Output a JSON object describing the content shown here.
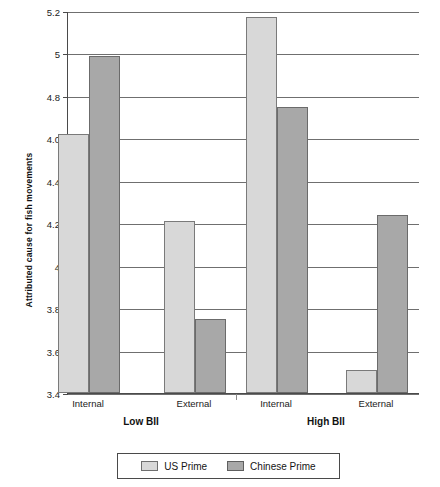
{
  "chart_data": {
    "type": "bar",
    "title": "",
    "xlabel": "",
    "ylabel": "Attributed cause for fish movements",
    "ylim": [
      3.4,
      5.2
    ],
    "grid": true,
    "legend_position": "bottom",
    "ytick_labels": [
      "5.2",
      "5",
      "4.8",
      "4.0",
      "4.4",
      "4.2",
      "4",
      "3.8",
      "3.6",
      "3.4"
    ],
    "ytick_values": [
      5.2,
      5.0,
      4.8,
      4.6,
      4.4,
      4.2,
      4.0,
      3.8,
      3.6,
      3.4
    ],
    "group_labels": [
      "Low BII",
      "High BII"
    ],
    "categories": [
      "Internal",
      "External",
      "Internal",
      "External"
    ],
    "series": [
      {
        "name": "US Prime",
        "color": "#d8d8d8",
        "values": [
          4.62,
          4.21,
          5.17,
          3.51
        ]
      },
      {
        "name": "Chinese Prime",
        "color": "#a8a8a8",
        "values": [
          4.99,
          3.75,
          4.75,
          4.24
        ]
      }
    ]
  }
}
